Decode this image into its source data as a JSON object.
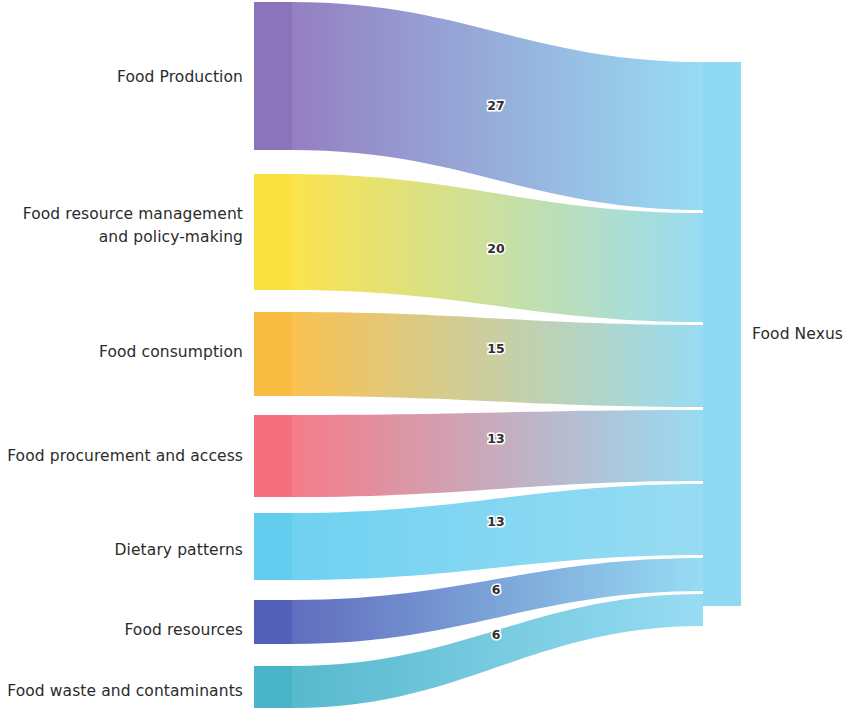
{
  "diagram": {
    "target_node": {
      "id": "food-nexus",
      "label": "Food Nexus",
      "total": 100,
      "color": "#8fd9f2"
    },
    "source_nodes": [
      {
        "id": "food-production",
        "label": "Food Production",
        "value": 27,
        "color": "#8b74bc",
        "label_lines": [
          "Food Production"
        ]
      },
      {
        "id": "food-resource-mgmt",
        "label": "Food resource management and policy-making",
        "value": 20,
        "color": "#fbe13d",
        "label_lines": [
          "Food resource management",
          "and policy-making"
        ]
      },
      {
        "id": "food-consumption",
        "label": "Food consumption",
        "value": 15,
        "color": "#f9bc42",
        "label_lines": [
          "Food consumption"
        ]
      },
      {
        "id": "food-procurement",
        "label": "Food procurement and access",
        "value": 13,
        "color": "#f4707e",
        "label_lines": [
          "Food procurement and access"
        ]
      },
      {
        "id": "dietary-patterns",
        "label": "Dietary patterns",
        "value": 13,
        "color": "#63cdf0",
        "label_lines": [
          "Dietary patterns"
        ]
      },
      {
        "id": "food-resources",
        "label": "Food resources",
        "value": 6,
        "color": "#5360b8",
        "label_lines": [
          "Food resources"
        ]
      },
      {
        "id": "food-waste",
        "label": "Food waste and contaminants",
        "value": 6,
        "color": "#49b3c8",
        "label_lines": [
          "Food waste and contaminants"
        ]
      }
    ],
    "links": [
      {
        "id": "link-food-production",
        "source": "food-production",
        "target": "food-nexus",
        "value": 27,
        "value_label": "27"
      },
      {
        "id": "link-food-resource-mgmt",
        "source": "food-resource-mgmt",
        "target": "food-nexus",
        "value": 20,
        "value_label": "20"
      },
      {
        "id": "link-food-consumption",
        "source": "food-consumption",
        "target": "food-nexus",
        "value": 15,
        "value_label": "15"
      },
      {
        "id": "link-food-procurement",
        "source": "food-procurement",
        "target": "food-nexus",
        "value": 13,
        "value_label": "13"
      },
      {
        "id": "link-dietary-patterns",
        "source": "dietary-patterns",
        "target": "food-nexus",
        "value": 13,
        "value_label": "13"
      },
      {
        "id": "link-food-resources",
        "source": "food-resources",
        "target": "food-nexus",
        "value": 6,
        "value_label": "6"
      },
      {
        "id": "link-food-waste",
        "source": "food-waste",
        "target": "food-nexus",
        "value": 6,
        "value_label": "6"
      }
    ]
  },
  "chart_data": {
    "type": "sankey",
    "title": "Food Nexus",
    "xlabel": "",
    "ylabel": "",
    "nodes": [
      "Food Production",
      "Food resource management and policy-making",
      "Food consumption",
      "Food procurement and access",
      "Dietary patterns",
      "Food resources",
      "Food waste and contaminants",
      "Food Nexus"
    ],
    "categories": [
      "Food Production",
      "Food resource management and policy-making",
      "Food consumption",
      "Food procurement and access",
      "Dietary patterns",
      "Food resources",
      "Food waste and contaminants"
    ],
    "values": [
      27,
      20,
      15,
      13,
      13,
      6,
      6
    ],
    "links": [
      {
        "source": "Food Production",
        "target": "Food Nexus",
        "value": 27
      },
      {
        "source": "Food resource management and policy-making",
        "target": "Food Nexus",
        "value": 20
      },
      {
        "source": "Food consumption",
        "target": "Food Nexus",
        "value": 15
      },
      {
        "source": "Food procurement and access",
        "target": "Food Nexus",
        "value": 13
      },
      {
        "source": "Dietary patterns",
        "target": "Food Nexus",
        "value": 13
      },
      {
        "source": "Food resources",
        "target": "Food Nexus",
        "value": 6
      },
      {
        "source": "Food waste and contaminants",
        "target": "Food Nexus",
        "value": 6
      }
    ],
    "legend": [],
    "grid": false,
    "total": 100
  },
  "geometry": {
    "width": 846,
    "height": 708,
    "source_x": 254,
    "source_width": 38,
    "target_x": 703,
    "target_width": 38,
    "target_top": 62,
    "target_bottom": 606,
    "source_bands": [
      {
        "id": "food-production",
        "top": 2,
        "bottom": 150
      },
      {
        "id": "food-resource-mgmt",
        "top": 174,
        "bottom": 290
      },
      {
        "id": "food-consumption",
        "top": 312,
        "bottom": 396
      },
      {
        "id": "food-procurement",
        "top": 415,
        "bottom": 497
      },
      {
        "id": "dietary-patterns",
        "top": 513,
        "bottom": 580
      },
      {
        "id": "food-resources",
        "top": 600,
        "bottom": 644
      },
      {
        "id": "food-waste",
        "top": 666,
        "bottom": 708
      }
    ],
    "target_bands": [
      {
        "id": "food-production",
        "top": 62,
        "bottom": 210
      },
      {
        "id": "food-resource-mgmt",
        "top": 213,
        "bottom": 322
      },
      {
        "id": "food-consumption",
        "top": 325,
        "bottom": 407
      },
      {
        "id": "food-procurement",
        "top": 410,
        "bottom": 481
      },
      {
        "id": "dietary-patterns",
        "top": 484,
        "bottom": 555
      },
      {
        "id": "food-resources",
        "top": 558,
        "bottom": 591
      },
      {
        "id": "food-waste",
        "top": 594,
        "bottom": 626
      }
    ],
    "labels": [
      {
        "id": "food-production",
        "x": 243,
        "y": 82,
        "lines": 1
      },
      {
        "id": "food-resource-mgmt",
        "x": 243,
        "y": 219,
        "lines": 2
      },
      {
        "id": "food-consumption",
        "x": 243,
        "y": 357,
        "lines": 1
      },
      {
        "id": "food-procurement",
        "x": 243,
        "y": 461,
        "lines": 1
      },
      {
        "id": "dietary-patterns",
        "x": 243,
        "y": 555,
        "lines": 1
      },
      {
        "id": "food-resources",
        "x": 243,
        "y": 635,
        "lines": 1
      },
      {
        "id": "food-waste",
        "x": 243,
        "y": 696,
        "lines": 1
      },
      {
        "id": "food-nexus",
        "x": 752,
        "y": 339,
        "lines": 1
      }
    ],
    "value_labels": [
      {
        "id": "link-food-production",
        "x": 496,
        "y": 110
      },
      {
        "id": "link-food-resource-mgmt",
        "x": 496,
        "y": 253
      },
      {
        "id": "link-food-consumption",
        "x": 496,
        "y": 353
      },
      {
        "id": "link-food-procurement",
        "x": 496,
        "y": 443
      },
      {
        "id": "link-dietary-patterns",
        "x": 496,
        "y": 526
      },
      {
        "id": "link-food-resources",
        "x": 496,
        "y": 594
      },
      {
        "id": "link-food-waste",
        "x": 496,
        "y": 639
      }
    ]
  }
}
